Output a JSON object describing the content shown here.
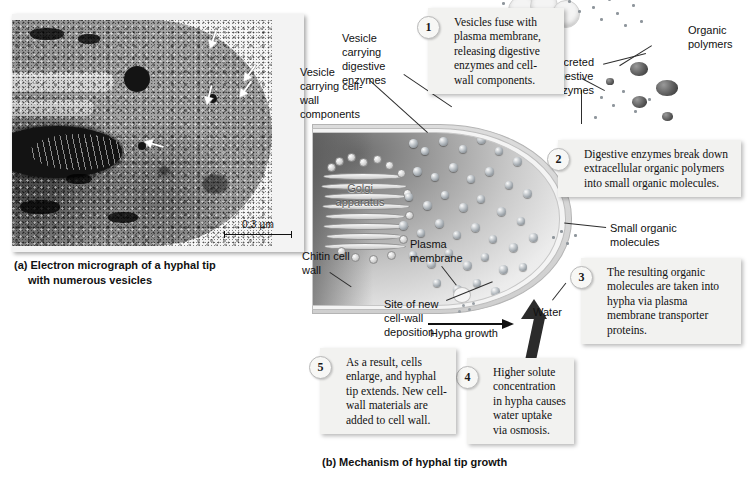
{
  "figure": {
    "panel_a": {
      "caption_line1": "(a) Electron micrograph of a hyphal tip",
      "caption_line2": "with numerous vesicles",
      "scale_bar": "0.3 µm"
    },
    "panel_b": {
      "caption": "(b) Mechanism of hyphal tip growth",
      "steps": [
        {
          "number": "1",
          "text": "Vesicles fuse with plasma membrane, releasing digestive enzymes and cell-wall components."
        },
        {
          "number": "2",
          "text": "Digestive enzymes break down extracellular organic polymers into small organic molecules."
        },
        {
          "number": "3",
          "text": "The resulting organic molecules are taken into hypha via plasma membrane transporter proteins."
        },
        {
          "number": "4",
          "text": "Higher solute concentration in hypha causes water uptake via osmosis."
        },
        {
          "number": "5",
          "text": "As a result, cells enlarge, and hyphal tip extends. New cell-wall materials are added to cell wall."
        }
      ],
      "labels": {
        "vesicle_cell_wall": "Vesicle carrying cell-wall components",
        "vesicle_digestive": "Vesicle carrying digestive enzymes",
        "secreted_enzymes": "Secreted digestive enzymes",
        "organic_polymers": "Organic polymers",
        "small_organic_molecules": "Small organic molecules",
        "golgi": "Golgi apparatus",
        "chitin_cell_wall": "Chitin cell wall",
        "plasma_membrane": "Plasma membrane",
        "site_new_deposition": "Site of new cell-wall deposition",
        "hypha_growth": "Hypha growth",
        "water": "Water"
      }
    }
  },
  "colors": {
    "box_fill": "#f2f2f0",
    "ink": "#111111",
    "cytoplasm_dark": "#6f6f6f",
    "cytoplasm_light": "#f6f6f6"
  }
}
